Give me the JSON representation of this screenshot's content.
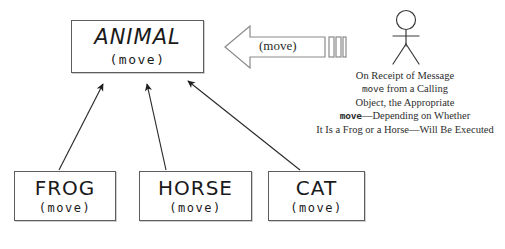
{
  "diagram": {
    "stroke_color": "#5d5d5d",
    "text_color": "#1a1a1a"
  },
  "classes": {
    "animal": {
      "name": "ANIMAL",
      "operation": "(move)"
    },
    "frog": {
      "name": "FROG",
      "operation": "(move)"
    },
    "horse": {
      "name": "HORSE",
      "operation": "(move)"
    },
    "cat": {
      "name": "CAT",
      "operation": "(move)"
    }
  },
  "message_arrow": {
    "label": "(move)",
    "direction": "left",
    "icon": "block-arrow-left-icon"
  },
  "actor": {
    "icon": "actor-stick-figure-icon",
    "label": ""
  },
  "caption": {
    "line1": "On Receipt of Message",
    "line2_mono": "move",
    "line2_rest": " from a Calling",
    "line3": "Object, the Appropriate",
    "line4_mono": "move",
    "line4_rest": "—Depending on Whether",
    "line5": "It Is a Frog or a Horse—Will Be Executed"
  },
  "relations": [
    {
      "from": "frog",
      "to": "animal",
      "type": "generalization"
    },
    {
      "from": "horse",
      "to": "animal",
      "type": "generalization"
    },
    {
      "from": "cat",
      "to": "animal",
      "type": "generalization"
    }
  ]
}
